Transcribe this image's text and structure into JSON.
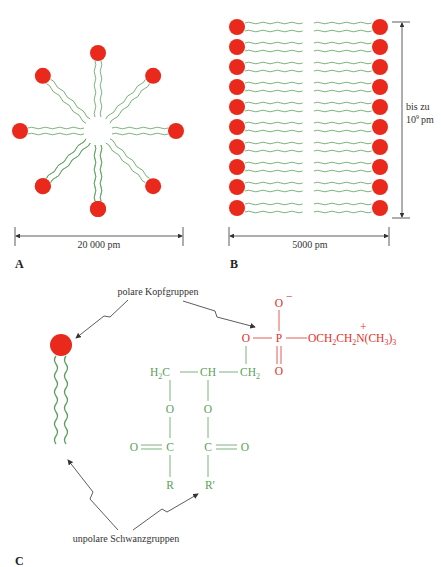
{
  "figure": {
    "colors": {
      "head": "#e8291c",
      "tail": "#5aa05a",
      "polar_text": "#e0302a",
      "glycerol_text": "#5aa05a",
      "annotation": "#333333"
    },
    "panel_a": {
      "label": "A",
      "caption": "micelle",
      "dimension_label": "20 000 pm",
      "head_count": 8
    },
    "panel_b": {
      "label": "B",
      "caption": "bilayer",
      "width_dimension_label": "5000 pm",
      "height_dimension_line1": "bis zu",
      "height_dimension_line2_base": "10",
      "height_dimension_line2_exp": "9",
      "height_dimension_line2_unit": "pm",
      "rows": 10
    },
    "panel_c": {
      "label": "C",
      "annotation_top": "polare Kopfgruppen",
      "annotation_bottom": "unpolare Schwanzgruppen",
      "structure": {
        "o_minus": "O",
        "minus_sign": "−",
        "o_left": "O",
        "p": "P",
        "o_bottom": "O",
        "choline_chain": "OCH",
        "sub2a": "2",
        "ch_a": "CH",
        "sub2b": "2",
        "n": "N",
        "plus_sign": "+",
        "methyl": "(CH",
        "sub3a": "3",
        "close": ")",
        "sub3b": "3",
        "h2c_h": "H",
        "h2c_sub": "2",
        "h2c_c": "C",
        "ch": "CH",
        "ch2": "CH",
        "ch2_sub": "2",
        "ester_o1": "O",
        "ester_o2": "O",
        "carbonyl_o_left": "O",
        "c1": "C",
        "c2": "C",
        "carbonyl_o_right": "O",
        "r": "R",
        "r_prime": "R′"
      }
    }
  }
}
